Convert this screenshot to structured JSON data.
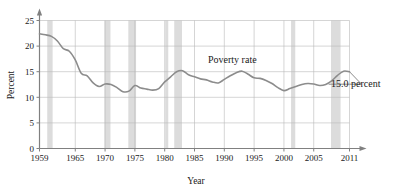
{
  "chart_data": {
    "type": "line",
    "title": "",
    "xlabel": "Year",
    "ylabel": "Percent",
    "xlim": [
      1959,
      2011
    ],
    "ylim": [
      0,
      25
    ],
    "grid": true,
    "legend_position": "inline-annotation",
    "series_name": "Poverty rate",
    "end_annotation": "15.0 percent",
    "y_ticks": [
      "0",
      "5",
      "10",
      "15",
      "20",
      "25"
    ],
    "y_tick_values": [
      0,
      5,
      10,
      15,
      20,
      25
    ],
    "x_ticks": [
      "1959",
      "1965",
      "1970",
      "1975",
      "1980",
      "1985",
      "1990",
      "1995",
      "2000",
      "2005",
      "2011"
    ],
    "x_tick_values": [
      1959,
      1965,
      1970,
      1975,
      1980,
      1985,
      1990,
      1995,
      2000,
      2005,
      2011
    ],
    "x": [
      1959,
      1960,
      1961,
      1962,
      1963,
      1964,
      1965,
      1966,
      1967,
      1968,
      1969,
      1970,
      1971,
      1972,
      1973,
      1974,
      1975,
      1976,
      1977,
      1978,
      1979,
      1980,
      1981,
      1982,
      1983,
      1984,
      1985,
      1986,
      1987,
      1988,
      1989,
      1990,
      1991,
      1992,
      1993,
      1994,
      1995,
      1996,
      1997,
      1998,
      1999,
      2000,
      2001,
      2002,
      2003,
      2004,
      2005,
      2006,
      2007,
      2008,
      2009,
      2010,
      2011
    ],
    "values": [
      22.4,
      22.2,
      21.9,
      21.0,
      19.5,
      19.0,
      17.3,
      14.7,
      14.2,
      12.8,
      12.1,
      12.6,
      12.5,
      11.9,
      11.1,
      11.2,
      12.3,
      11.8,
      11.6,
      11.4,
      11.7,
      13.0,
      14.0,
      15.0,
      15.2,
      14.4,
      14.0,
      13.6,
      13.4,
      13.0,
      12.8,
      13.5,
      14.2,
      14.8,
      15.1,
      14.5,
      13.8,
      13.7,
      13.3,
      12.7,
      11.9,
      11.3,
      11.7,
      12.1,
      12.5,
      12.7,
      12.6,
      12.3,
      12.5,
      13.2,
      14.3,
      15.1,
      15.0
    ],
    "recession_bands": [
      {
        "start": 1960.3,
        "end": 1961.2
      },
      {
        "start": 1969.9,
        "end": 1970.9
      },
      {
        "start": 1973.9,
        "end": 1975.2
      },
      {
        "start": 1980.1,
        "end": 1980.6
      },
      {
        "start": 1981.6,
        "end": 1982.9
      },
      {
        "start": 2001.2,
        "end": 2001.9
      },
      {
        "start": 2007.9,
        "end": 2009.5
      }
    ],
    "band_color": "#dcdcdc",
    "line_color": "#8c8c8c",
    "grid_color": "#b8b8b8",
    "axis_color": "#808080"
  }
}
